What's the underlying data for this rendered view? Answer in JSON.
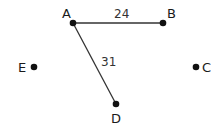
{
  "diagram": {
    "type": "graph",
    "nodes": [
      {
        "id": "A",
        "label": "A",
        "x": 73,
        "y": 23,
        "label_x": 62,
        "label_y": 18
      },
      {
        "id": "B",
        "label": "B",
        "x": 163,
        "y": 23,
        "label_x": 167,
        "label_y": 18
      },
      {
        "id": "C",
        "label": "C",
        "x": 196,
        "y": 67,
        "label_x": 202,
        "label_y": 72
      },
      {
        "id": "D",
        "label": "D",
        "x": 116,
        "y": 104,
        "label_x": 111,
        "label_y": 123
      },
      {
        "id": "E",
        "label": "E",
        "x": 34,
        "y": 67,
        "label_x": 18,
        "label_y": 72
      }
    ],
    "edges": [
      {
        "from": "A",
        "to": "B",
        "weight": "24",
        "label_x": 114,
        "label_y": 18
      },
      {
        "from": "A",
        "to": "D",
        "weight": "31",
        "label_x": 101,
        "label_y": 66
      }
    ],
    "colors": {
      "node": "#111111",
      "edge": "#333333",
      "text": "#1a1a1a"
    }
  }
}
